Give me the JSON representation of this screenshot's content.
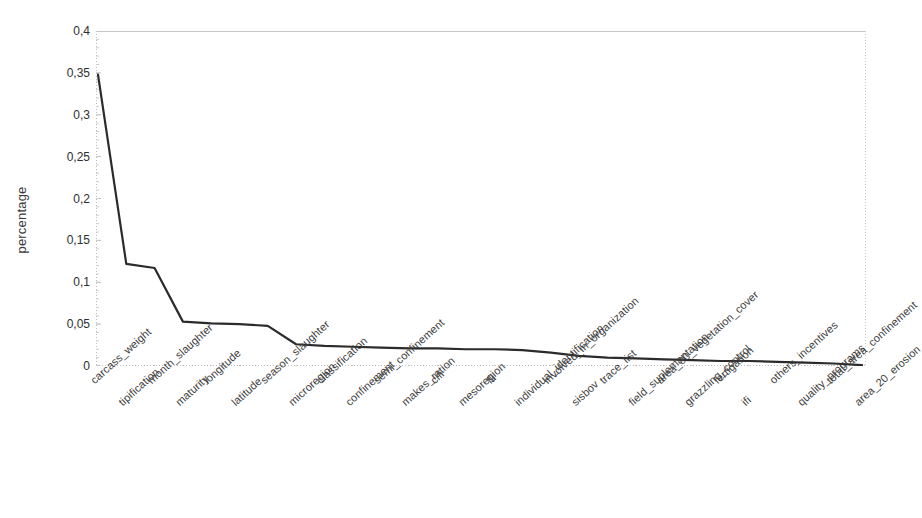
{
  "chart_data": {
    "type": "line",
    "title": "",
    "xlabel": "",
    "ylabel": "percentage",
    "ylim": [
      0,
      0.4
    ],
    "ytick_labels": [
      "0,4",
      "0,35",
      "0,3",
      "0,25",
      "0,2",
      "0,15",
      "0,1",
      "0,05",
      "0"
    ],
    "ytick_values": [
      0.4,
      0.35,
      0.3,
      0.25,
      0.2,
      0.15,
      0.1,
      0.05,
      0
    ],
    "grid": false,
    "legend": "none",
    "line_color": "#2b2b2b",
    "axis_color": "#b9b9b9",
    "categories": [
      "carcass_weight",
      "tipification",
      "month_slaughter",
      "maturity",
      "longitude",
      "latitude",
      "season_slaughter",
      "microregion",
      "classification",
      "confinement",
      "semi_confinement",
      "makes_ration",
      "clfi",
      "mesoregion",
      "fli",
      "individual_identification",
      "involved_in_organization",
      "sisbov",
      "trace_list",
      "field_suplemantation",
      "area_80_vegetation_cover",
      "grazzling_control",
      "fertigation",
      "ifi",
      "others_incentives",
      "quality_programs",
      "total_area_confinement",
      "area_20_erosion"
    ],
    "values": [
      0.348,
      0.122,
      0.117,
      0.053,
      0.051,
      0.05,
      0.048,
      0.026,
      0.024,
      0.023,
      0.022,
      0.021,
      0.021,
      0.02,
      0.02,
      0.019,
      0.016,
      0.012,
      0.01,
      0.009,
      0.008,
      0.007,
      0.006,
      0.006,
      0.005,
      0.004,
      0.003,
      0.001
    ]
  },
  "axes": {
    "y_title": "percentage"
  },
  "artifacts": {
    "speck": "·"
  }
}
